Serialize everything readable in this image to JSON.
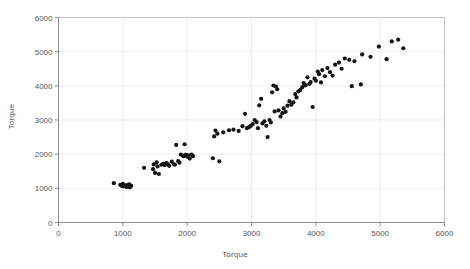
{
  "chart_data": {
    "type": "scatter",
    "title": "",
    "xlabel": "Torque",
    "ylabel": "Torque",
    "xlim": [
      0,
      6000
    ],
    "ylim": [
      0,
      6000
    ],
    "xticks": [
      0,
      1000,
      2000,
      3000,
      4000,
      5000,
      6000
    ],
    "yticks": [
      0,
      1000,
      2000,
      3000,
      4000,
      5000,
      6000
    ],
    "xtick_labels": [
      "0",
      "1000",
      "2000",
      "3000",
      "4000",
      "5000",
      "6000"
    ],
    "ytick_labels": [
      "0",
      "1000",
      "2000",
      "3000",
      "4000",
      "5000",
      "6000"
    ],
    "grid": true,
    "legend": null,
    "marker": "circle",
    "marker_color": "#141414",
    "marker_size": 2.1,
    "series": [
      {
        "name": "Torque",
        "points": [
          [
            860,
            1150
          ],
          [
            960,
            1100
          ],
          [
            985,
            1070
          ],
          [
            1000,
            1130
          ],
          [
            1010,
            1060
          ],
          [
            1035,
            1085
          ],
          [
            1055,
            1040
          ],
          [
            1075,
            1095
          ],
          [
            1090,
            1055
          ],
          [
            1100,
            1120
          ],
          [
            1110,
            1030
          ],
          [
            1130,
            1075
          ],
          [
            1330,
            1600
          ],
          [
            1470,
            1560
          ],
          [
            1480,
            1700
          ],
          [
            1500,
            1450
          ],
          [
            1525,
            1760
          ],
          [
            1540,
            1640
          ],
          [
            1560,
            1420
          ],
          [
            1600,
            1690
          ],
          [
            1630,
            1720
          ],
          [
            1650,
            1680
          ],
          [
            1680,
            1740
          ],
          [
            1700,
            1700
          ],
          [
            1720,
            1660
          ],
          [
            1760,
            1780
          ],
          [
            1790,
            1710
          ],
          [
            1810,
            1690
          ],
          [
            1830,
            2270
          ],
          [
            1860,
            1800
          ],
          [
            1880,
            1750
          ],
          [
            1900,
            1990
          ],
          [
            1930,
            1960
          ],
          [
            1950,
            1940
          ],
          [
            1960,
            2290
          ],
          [
            1980,
            1985
          ],
          [
            2000,
            1930
          ],
          [
            2020,
            1965
          ],
          [
            2040,
            1870
          ],
          [
            2070,
            1990
          ],
          [
            2090,
            1940
          ],
          [
            2400,
            1880
          ],
          [
            2420,
            2520
          ],
          [
            2440,
            2690
          ],
          [
            2470,
            2600
          ],
          [
            2500,
            1790
          ],
          [
            2560,
            2640
          ],
          [
            2650,
            2700
          ],
          [
            2720,
            2720
          ],
          [
            2800,
            2680
          ],
          [
            2860,
            2820
          ],
          [
            2900,
            3180
          ],
          [
            2930,
            2760
          ],
          [
            2960,
            2790
          ],
          [
            2990,
            2830
          ],
          [
            3020,
            2880
          ],
          [
            3050,
            3000
          ],
          [
            3080,
            2940
          ],
          [
            3100,
            2760
          ],
          [
            3120,
            3430
          ],
          [
            3150,
            3620
          ],
          [
            3170,
            2900
          ],
          [
            3200,
            2960
          ],
          [
            3230,
            2830
          ],
          [
            3250,
            2500
          ],
          [
            3280,
            3000
          ],
          [
            3300,
            2930
          ],
          [
            3320,
            3810
          ],
          [
            3340,
            4010
          ],
          [
            3360,
            3250
          ],
          [
            3380,
            3980
          ],
          [
            3400,
            3900
          ],
          [
            3420,
            3280
          ],
          [
            3450,
            3100
          ],
          [
            3480,
            3200
          ],
          [
            3500,
            3340
          ],
          [
            3530,
            3240
          ],
          [
            3560,
            3420
          ],
          [
            3590,
            3550
          ],
          [
            3620,
            3450
          ],
          [
            3650,
            3520
          ],
          [
            3680,
            3760
          ],
          [
            3700,
            3660
          ],
          [
            3730,
            3840
          ],
          [
            3760,
            3880
          ],
          [
            3790,
            3960
          ],
          [
            3810,
            4080
          ],
          [
            3840,
            4020
          ],
          [
            3870,
            4250
          ],
          [
            3900,
            4060
          ],
          [
            3920,
            4110
          ],
          [
            3950,
            3380
          ],
          [
            3980,
            4210
          ],
          [
            4000,
            4150
          ],
          [
            4030,
            4420
          ],
          [
            4050,
            4340
          ],
          [
            4080,
            4100
          ],
          [
            4100,
            4460
          ],
          [
            4140,
            4280
          ],
          [
            4180,
            4520
          ],
          [
            4220,
            4400
          ],
          [
            4260,
            4300
          ],
          [
            4300,
            4620
          ],
          [
            4360,
            4680
          ],
          [
            4400,
            4500
          ],
          [
            4450,
            4800
          ],
          [
            4520,
            4760
          ],
          [
            4560,
            3990
          ],
          [
            4600,
            4720
          ],
          [
            4700,
            4040
          ],
          [
            4720,
            4920
          ],
          [
            4850,
            4850
          ],
          [
            4980,
            5150
          ],
          [
            5100,
            4780
          ],
          [
            5180,
            5300
          ],
          [
            5280,
            5350
          ],
          [
            5360,
            5100
          ]
        ]
      }
    ]
  },
  "axes": {
    "y_title": "Torque",
    "x_title": "Torque"
  }
}
